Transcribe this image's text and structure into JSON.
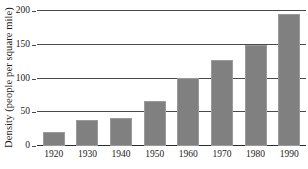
{
  "chart_data": {
    "type": "bar",
    "title": "",
    "subtitle": "",
    "xlabel": "",
    "ylabel": "Density (people per square mile)",
    "categories": [
      "1920",
      "1930",
      "1940",
      "1950",
      "1960",
      "1970",
      "1980",
      "1990"
    ],
    "values": [
      21,
      38,
      42,
      67,
      101,
      127,
      150,
      196
    ],
    "ylim": [
      0,
      200
    ],
    "yticks": [
      0,
      50,
      100,
      150,
      200
    ],
    "ytick_labels": [
      "0",
      "50",
      "100",
      "150",
      "200"
    ],
    "grid": true,
    "grid_axis": "y",
    "legend": false,
    "legend_position": "none",
    "bar_color": "#808080",
    "bar_edge_color": "#9a9a9a",
    "axis_color": "#2b2b2b",
    "grid_color": "#4a4a4a",
    "background_color": "#ffffff",
    "series": [
      {
        "name": "Density",
        "values": [
          21,
          38,
          42,
          67,
          101,
          127,
          150,
          196
        ]
      }
    ]
  }
}
